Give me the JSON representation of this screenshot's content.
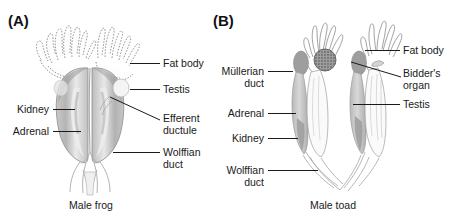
{
  "figure": {
    "background_color": "#ffffff",
    "line_color": "#1a1a1a"
  },
  "panels": [
    {
      "id": "panel-a",
      "letter": "(A)",
      "caption": "Male frog",
      "labels": [
        {
          "name": "fat-body",
          "text_lines": [
            "Fat body"
          ]
        },
        {
          "name": "testis",
          "text_lines": [
            "Testis"
          ]
        },
        {
          "name": "efferent-ductule",
          "text_lines": [
            "Efferent",
            "ductule"
          ]
        },
        {
          "name": "wolffian-duct",
          "text_lines": [
            "Wolffian",
            "duct"
          ]
        },
        {
          "name": "kidney",
          "text_lines": [
            "Kidney"
          ]
        },
        {
          "name": "adrenal",
          "text_lines": [
            "Adrenal"
          ]
        }
      ]
    },
    {
      "id": "panel-b",
      "letter": "(B)",
      "caption": "Male toad",
      "labels": [
        {
          "name": "fat-body",
          "text_lines": [
            "Fat body"
          ]
        },
        {
          "name": "bidders-organ",
          "text_lines": [
            "Bidder's",
            "organ"
          ]
        },
        {
          "name": "testis",
          "text_lines": [
            "Testis"
          ]
        },
        {
          "name": "mullerian-duct",
          "text_lines": [
            "Müllerian",
            "duct"
          ]
        },
        {
          "name": "adrenal",
          "text_lines": [
            "Adrenal"
          ]
        },
        {
          "name": "kidney",
          "text_lines": [
            "Kidney"
          ]
        },
        {
          "name": "wolffian-duct",
          "text_lines": [
            "Wolffian",
            "duct"
          ]
        }
      ]
    }
  ],
  "panel_a": {
    "letter": "(A)",
    "caption": "Male frog",
    "fat_body": "Fat body",
    "testis": "Testis",
    "efferent_1": "Efferent",
    "efferent_2": "ductule",
    "wolffian_1": "Wolffian",
    "wolffian_2": "duct",
    "kidney": "Kidney",
    "adrenal": "Adrenal"
  },
  "panel_b": {
    "letter": "(B)",
    "caption": "Male toad",
    "fat_body": "Fat body",
    "bidders_1": "Bidder's",
    "bidders_2": "organ",
    "testis": "Testis",
    "mullerian_1": "Müllerian",
    "mullerian_2": "duct",
    "adrenal": "Adrenal",
    "kidney": "Kidney",
    "wolffian_1": "Wolffian",
    "wolffian_2": "duct"
  }
}
